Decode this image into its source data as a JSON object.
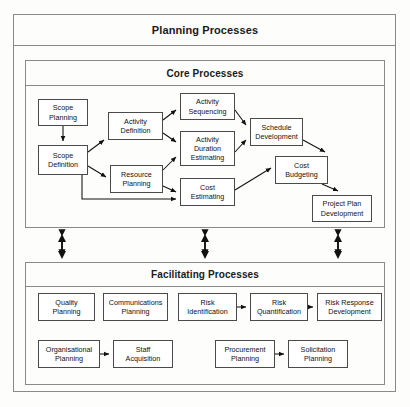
{
  "diagram": {
    "outer_title": "Planning Processes",
    "core_title": "Core Processes",
    "facilitating_title": "Facilitating Processes"
  },
  "core_nodes": [
    {
      "id": "scope-planning",
      "label": "Scope\nPlanning",
      "line1": "Scope",
      "line2": "Planning",
      "x": 38,
      "y": 99,
      "w": 50,
      "h": 27
    },
    {
      "id": "scope-definition",
      "label": "Scope\nDefinition",
      "line1": "Scope",
      "line2": "Definition",
      "x": 38,
      "y": 145,
      "w": 50,
      "h": 30
    },
    {
      "id": "activity-definition",
      "label": "Activity\nDefinition",
      "line1": "Activity",
      "line2": "Definition",
      "x": 108,
      "y": 112,
      "w": 55,
      "h": 28
    },
    {
      "id": "resource-planning",
      "label": "Resource\nPlanning",
      "line1": "Resource",
      "line2": "Planning",
      "x": 110,
      "y": 165,
      "w": 53,
      "h": 28
    },
    {
      "id": "activity-sequencing",
      "label": "Activity\nSequencing",
      "line1": "Activity",
      "line2": "Sequencing",
      "x": 180,
      "y": 93,
      "w": 55,
      "h": 27
    },
    {
      "id": "activity-duration-estimating",
      "label": "Activity\nDuration\nEstimating",
      "line1": "Activity",
      "line2": "Duration",
      "line3": "Estimating",
      "x": 180,
      "y": 131,
      "w": 55,
      "h": 35
    },
    {
      "id": "cost-estimating",
      "label": "Cost\nEstimating",
      "line1": "Cost",
      "line2": "Estimating",
      "x": 180,
      "y": 178,
      "w": 55,
      "h": 28
    },
    {
      "id": "schedule-development",
      "label": "Schedule\nDevelopment",
      "line1": "Schedule",
      "line2": "Development",
      "x": 250,
      "y": 118,
      "w": 53,
      "h": 28
    },
    {
      "id": "cost-budgeting",
      "label": "Cost\nBudgeting",
      "line1": "Cost",
      "line2": "Budgeting",
      "x": 275,
      "y": 156,
      "w": 53,
      "h": 28
    },
    {
      "id": "project-plan-development",
      "label": "Project Plan\nDevelopment",
      "line1": "Project Plan",
      "line2": "Development",
      "x": 312,
      "y": 195,
      "w": 60,
      "h": 27
    }
  ],
  "facilitating_nodes": [
    {
      "id": "quality-planning",
      "label": "Quality\nPlanning",
      "line1": "Quality",
      "line2": "Planning",
      "x": 38,
      "y": 293,
      "w": 57,
      "h": 28
    },
    {
      "id": "communications-planning",
      "label": "Communications\nPlanning",
      "line1": "Communications",
      "line2": "Planning",
      "x": 103,
      "y": 293,
      "w": 65,
      "h": 28
    },
    {
      "id": "risk-identification",
      "label": "Risk\nIdentification",
      "line1": "Risk",
      "line2": "Identification",
      "x": 178,
      "y": 293,
      "w": 59,
      "h": 28
    },
    {
      "id": "risk-quantification",
      "label": "Risk\nQuantification",
      "line1": "Risk",
      "line2": "Quantification",
      "x": 250,
      "y": 293,
      "w": 58,
      "h": 28
    },
    {
      "id": "risk-response-development",
      "label": "Risk Response\nDevelopment",
      "line1": "Risk Response",
      "line2": "Development",
      "x": 317,
      "y": 293,
      "w": 65,
      "h": 28
    },
    {
      "id": "organisational-planning",
      "label": "Organisational\nPlanning",
      "line1": "Organisational",
      "line2": "Planning",
      "x": 38,
      "y": 340,
      "w": 62,
      "h": 28
    },
    {
      "id": "staff-acquisition",
      "label": "Staff\nAcquisition",
      "line1": "Staff",
      "line2": "Acquisition",
      "x": 113,
      "y": 340,
      "w": 60,
      "h": 28
    },
    {
      "id": "procurement-planning",
      "label": "Procurement\nPlanning",
      "line1": "Procurement",
      "line2": "Planning",
      "x": 215,
      "y": 340,
      "w": 60,
      "h": 28
    },
    {
      "id": "solicitation-planning",
      "label": "Solicitation\nPlanning",
      "line1": "Solicitation",
      "line2": "Planning",
      "x": 288,
      "y": 340,
      "w": 60,
      "h": 28
    }
  ],
  "connectors": {
    "core_links": [
      {
        "from": "scope-planning",
        "to": "scope-definition",
        "path": "M63,126 L63,141"
      },
      {
        "from": "scope-definition",
        "to": "activity-definition",
        "path": "M88,152 L104,140"
      },
      {
        "from": "scope-definition",
        "to": "resource-planning",
        "path": "M88,166 L106,177"
      },
      {
        "from": "scope-definition",
        "to": "cost-estimating",
        "path": "M82,175 L82,199 L176,199"
      },
      {
        "from": "activity-definition",
        "to": "activity-sequencing",
        "path": "M163,120 L176,110"
      },
      {
        "from": "activity-definition",
        "to": "activity-duration-estimating",
        "path": "M163,133 L176,142"
      },
      {
        "from": "resource-planning",
        "to": "activity-duration-estimating",
        "path": "M163,170 L176,157"
      },
      {
        "from": "resource-planning",
        "to": "cost-estimating",
        "path": "M163,186 L176,192"
      },
      {
        "from": "activity-sequencing",
        "to": "schedule-development",
        "path": "M235,110 L246,125"
      },
      {
        "from": "activity-duration-estimating",
        "to": "schedule-development",
        "path": "M235,152 L246,140"
      },
      {
        "from": "cost-estimating",
        "to": "cost-budgeting",
        "path": "M235,190 L271,168"
      },
      {
        "from": "schedule-development",
        "to": "cost-budgeting",
        "path": "M303,140 L325,152"
      },
      {
        "from": "cost-budgeting",
        "to": "project-plan-development",
        "path": "M322,184 L338,191"
      }
    ],
    "facilitating_links": [
      {
        "from": "risk-identification",
        "to": "risk-quantification",
        "path": "M237,307 L246,307"
      },
      {
        "from": "risk-quantification",
        "to": "risk-response-development",
        "path": "M308,307 L313,307"
      },
      {
        "from": "organisational-planning",
        "to": "staff-acquisition",
        "path": "M100,354 L109,354"
      },
      {
        "from": "procurement-planning",
        "to": "solicitation-planning",
        "path": "M275,354 L284,354"
      }
    ],
    "section_links": [
      {
        "name": "core-facilitating-link-left",
        "x": 62
      },
      {
        "name": "core-facilitating-link-center",
        "x": 205
      },
      {
        "name": "core-facilitating-link-right",
        "x": 338
      }
    ]
  }
}
